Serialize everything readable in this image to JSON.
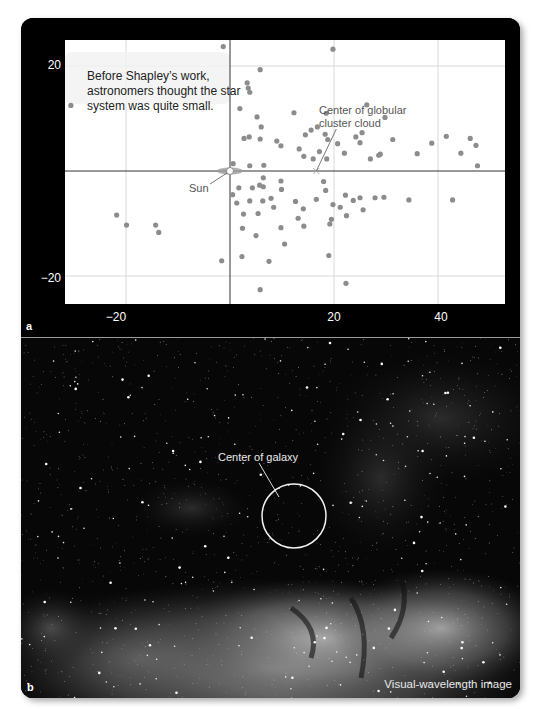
{
  "figure": {
    "panel_a_label": "a",
    "panel_b_label": "b"
  },
  "chart_data": {
    "type": "scatter",
    "title": "",
    "xlabel": "",
    "ylabel": "",
    "xlim": [
      -22,
      50
    ],
    "ylim": [
      -25,
      25
    ],
    "xticks": [
      -20,
      20,
      40
    ],
    "xtick_labels": [
      "−20",
      "20",
      "40"
    ],
    "yticks": [
      20,
      -20
    ],
    "ytick_labels": [
      "20",
      "−20"
    ],
    "grid": true,
    "axes_lines_through_origin": true,
    "series": [
      {
        "name": "Globular clusters",
        "color": "#8c8c8c",
        "points": [
          [
            -1.3,
            23.7
          ],
          [
            19.8,
            23.2
          ],
          [
            -30.6,
            12.5
          ],
          [
            5.8,
            19.3
          ],
          [
            3.3,
            16.8
          ],
          [
            3.5,
            15.8
          ],
          [
            3.8,
            15.0
          ],
          [
            1.9,
            11.9
          ],
          [
            5.2,
            10.3
          ],
          [
            6.0,
            8.4
          ],
          [
            2.7,
            6.2
          ],
          [
            3.7,
            6.5
          ],
          [
            5.8,
            6.1
          ],
          [
            9.0,
            5.7
          ],
          [
            9.8,
            4.8
          ],
          [
            12.3,
            11.1
          ],
          [
            18.5,
            11.0
          ],
          [
            26.3,
            12.6
          ],
          [
            29.8,
            10.2
          ],
          [
            41.6,
            6.6
          ],
          [
            46.2,
            6.2
          ],
          [
            47.3,
            4.9
          ],
          [
            47.6,
            1.0
          ],
          [
            13.3,
            4.2
          ],
          [
            14.5,
            6.9
          ],
          [
            15.6,
            7.8
          ],
          [
            16.8,
            8.4
          ],
          [
            18.3,
            7.0
          ],
          [
            18.8,
            6.0
          ],
          [
            20.7,
            5.2
          ],
          [
            17.2,
            3.7
          ],
          [
            14.2,
            2.8
          ],
          [
            16.0,
            2.3
          ],
          [
            18.6,
            2.3
          ],
          [
            22.0,
            3.4
          ],
          [
            24.2,
            6.5
          ],
          [
            25.4,
            7.3
          ],
          [
            25.0,
            5.4
          ],
          [
            27.0,
            2.3
          ],
          [
            28.9,
            3.2
          ],
          [
            31.3,
            6.0
          ],
          [
            28.6,
            3.0
          ],
          [
            36.0,
            3.3
          ],
          [
            38.8,
            5.3
          ],
          [
            44.4,
            3.4
          ],
          [
            0.6,
            1.4
          ],
          [
            3.8,
            1.0
          ],
          [
            6.5,
            1.1
          ],
          [
            6.4,
            -1.3
          ],
          [
            5.7,
            -2.7
          ],
          [
            1.7,
            -3.2
          ],
          [
            4.3,
            -3.2
          ],
          [
            6.4,
            -3.0
          ],
          [
            9.8,
            -1.9
          ],
          [
            9.9,
            -3.5
          ],
          [
            0.5,
            -4.5
          ],
          [
            1.3,
            -6.1
          ],
          [
            3.8,
            -5.7
          ],
          [
            6.3,
            -5.7
          ],
          [
            7.9,
            -5.2
          ],
          [
            12.6,
            -5.8
          ],
          [
            14.1,
            -7.2
          ],
          [
            2.6,
            -8.2
          ],
          [
            5.4,
            -8.1
          ],
          [
            8.4,
            -6.9
          ],
          [
            18.4,
            -3.7
          ],
          [
            18.0,
            -2.0
          ],
          [
            19.8,
            -6.4
          ],
          [
            21.2,
            -6.9
          ],
          [
            22.2,
            -4.6
          ],
          [
            23.7,
            -5.6
          ],
          [
            25.0,
            -5.1
          ],
          [
            25.6,
            -7.4
          ],
          [
            22.4,
            -8.5
          ],
          [
            19.5,
            -9.2
          ],
          [
            19.2,
            -10.1
          ],
          [
            16.6,
            -5.4
          ],
          [
            13.1,
            -9.0
          ],
          [
            14.2,
            -10.5
          ],
          [
            9.8,
            -10.8
          ],
          [
            10.5,
            -13.9
          ],
          [
            5.0,
            -12.3
          ],
          [
            2.4,
            -10.9
          ],
          [
            2.3,
            -16.3
          ],
          [
            19.0,
            -16.1
          ],
          [
            7.5,
            -17.2
          ],
          [
            27.9,
            -5.1
          ],
          [
            29.6,
            -5.0
          ],
          [
            34.4,
            -5.5
          ],
          [
            42.8,
            -5.5
          ],
          [
            -21.8,
            -8.4
          ],
          [
            -19.9,
            -10.3
          ],
          [
            -14.3,
            -10.3
          ],
          [
            -13.7,
            -11.7
          ],
          [
            -1.6,
            -17.1
          ],
          [
            5.8,
            -22.6
          ],
          [
            22.3,
            -21.4
          ]
        ]
      }
    ],
    "markers": [
      {
        "name": "Sun",
        "x": 0,
        "y": 0
      },
      {
        "name": "Center of globular cluster cloud",
        "x": 16.6,
        "y": 0
      }
    ],
    "annotations": [
      "Before Shapley’s work, astronomers thought the star system was quite small.",
      "Center of globular cluster cloud",
      "Sun"
    ]
  },
  "panel_a": {
    "note": "Before Shapley’s work, astronomers thought the star system was quite small.",
    "note_lines": [
      "Before Shapley’s work,",
      "astronomers thought the star",
      "system was quite small."
    ],
    "sun_label": "Sun",
    "center_label_lines": [
      "Center of globular",
      "cluster cloud"
    ]
  },
  "panel_b": {
    "center_label": "Center of galaxy",
    "caption": "Visual-wavelength image"
  }
}
